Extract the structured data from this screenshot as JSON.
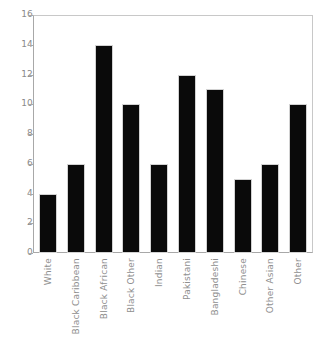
{
  "chart_data": {
    "type": "bar",
    "title": "",
    "subtitle": "",
    "xlabel": "",
    "ylabel": "",
    "categories": [
      "White",
      "Black Caribbean",
      "Black African",
      "Black Other",
      "Indian",
      "Pakistani",
      "Bangladeshi",
      "Chinese",
      "Other Asian",
      "Other"
    ],
    "values": [
      4,
      6,
      14,
      10,
      6,
      12,
      11,
      5,
      6,
      10
    ],
    "ylim": [
      0,
      16
    ],
    "ytick_values": [
      0,
      2,
      4,
      6,
      8,
      10,
      12,
      14,
      16
    ],
    "ytick_labels": [
      "0",
      "2",
      "4",
      "6",
      "8",
      "10",
      "12",
      "14",
      "16"
    ],
    "grid": false,
    "legend": null,
    "bar_color": "#0a0a0a",
    "axis_color": "#a8a8a8",
    "tick_label_color": "#8a8a8a",
    "frame_color": "#c8c8c8",
    "background": "#ffffff"
  },
  "caption": {
    "text": ""
  }
}
